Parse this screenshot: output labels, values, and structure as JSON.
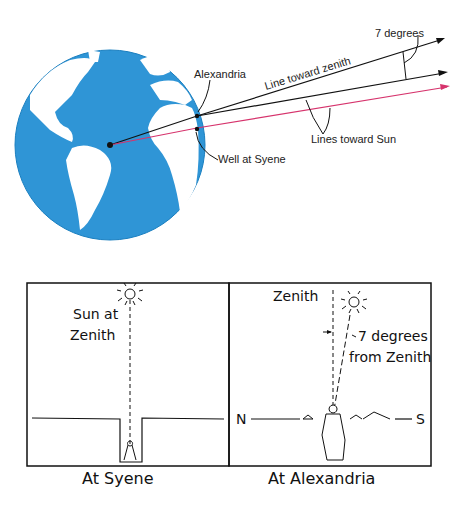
{
  "top_diagram": {
    "labels": {
      "alexandria": "Alexandria",
      "well_at_syene": "Well at Syene",
      "line_toward_zenith": "Line toward zenith",
      "lines_toward_sun": "Lines toward Sun",
      "angle": "7 degrees"
    },
    "colors": {
      "ocean": "#2f95d6",
      "land": "#ffffff",
      "rays": "#111111",
      "sun_ray_red": "#d6336c"
    }
  },
  "bottom_panels": [
    {
      "caption": "At Syene",
      "sun_label_line1": "Sun at",
      "sun_label_line2": "Zenith"
    },
    {
      "caption": "At Alexandria",
      "zenith_label": "Zenith",
      "angle_label_line1": "7 degrees",
      "angle_label_line2": "from Zenith",
      "north": "N",
      "south": "S"
    }
  ]
}
